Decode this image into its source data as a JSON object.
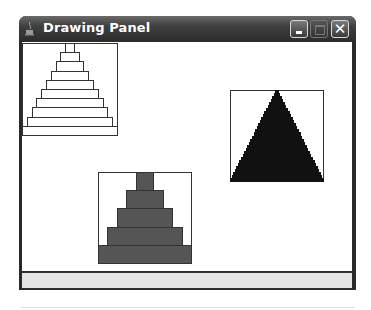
{
  "window": {
    "title": "Drawing Panel",
    "buttons": {
      "minimize": "minimize",
      "maximize": "maximize",
      "close": "✕"
    }
  },
  "canvas": {
    "pyramids": [
      {
        "name": "outlined-pyramid",
        "box": {
          "x": 22,
          "y": 43,
          "w": 96,
          "h": 92
        },
        "layers": 10,
        "fill": "#ffffff",
        "stroke": "#333333"
      },
      {
        "name": "black-pyramid",
        "box": {
          "x": 230,
          "y": 90,
          "w": 94,
          "h": 91
        },
        "layers": 30,
        "fill": "#111111",
        "stroke": "#111111"
      },
      {
        "name": "gray-pyramid",
        "box": {
          "x": 98,
          "y": 172,
          "w": 94,
          "h": 91
        },
        "layers": 5,
        "fill": "#555555",
        "stroke": "#333333"
      }
    ]
  },
  "status_bar": {
    "text": ""
  }
}
